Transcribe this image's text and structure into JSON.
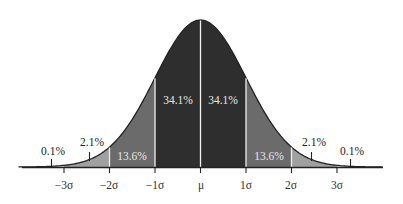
{
  "chart_data": {
    "type": "area",
    "title": "",
    "subtitle": "",
    "xlabel": "",
    "ylabel": "",
    "distribution": "normal",
    "x_ticks": [
      "−3σ",
      "−2σ",
      "−1σ",
      "μ",
      "1σ",
      "2σ",
      "3σ"
    ],
    "x_tick_values": [
      -3,
      -2,
      -1,
      0,
      1,
      2,
      3
    ],
    "xlim": [
      -4,
      4
    ],
    "grid": false,
    "legend": null,
    "regions": [
      {
        "from": -4,
        "to": -3,
        "percent": "0.1%",
        "fill": "#ffffff"
      },
      {
        "from": -3,
        "to": -2,
        "percent": "2.1%",
        "fill": "#a0a0a0"
      },
      {
        "from": -2,
        "to": -1,
        "percent": "13.6%",
        "fill": "#6b6b6b"
      },
      {
        "from": -1,
        "to": 0,
        "percent": "34.1%",
        "fill": "#2e2e2e"
      },
      {
        "from": 0,
        "to": 1,
        "percent": "34.1%",
        "fill": "#2e2e2e"
      },
      {
        "from": 1,
        "to": 2,
        "percent": "13.6%",
        "fill": "#6b6b6b"
      },
      {
        "from": 2,
        "to": 3,
        "percent": "2.1%",
        "fill": "#a0a0a0"
      },
      {
        "from": 3,
        "to": 4,
        "percent": "0.1%",
        "fill": "#ffffff"
      }
    ],
    "values": [
      0.1,
      2.1,
      13.6,
      34.1,
      34.1,
      13.6,
      2.1,
      0.1
    ],
    "categories": [
      "<−3σ",
      "−3σ to −2σ",
      "−2σ to −1σ",
      "−1σ to μ",
      "μ to 1σ",
      "1σ to 2σ",
      "2σ to 3σ",
      ">3σ"
    ]
  },
  "labels": {
    "outer_left": "0.1%",
    "tail_left": "2.1%",
    "mid_left": "13.6%",
    "center_left": "34.1%",
    "center_right": "34.1%",
    "mid_right": "13.6%",
    "tail_right": "2.1%",
    "outer_right": "0.1%"
  },
  "ticks": {
    "m3": "−3σ",
    "m2": "−2σ",
    "m1": "−1σ",
    "mu": "μ",
    "p1": "1σ",
    "p2": "2σ",
    "p3": "3σ"
  },
  "colors": {
    "dark": "#2e2e2e",
    "mid": "#6b6b6b",
    "light": "#a0a0a0",
    "divider": "#f0f0f0",
    "axis": "#222222"
  }
}
